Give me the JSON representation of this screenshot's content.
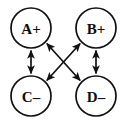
{
  "diagram": {
    "type": "graph",
    "title": "",
    "width": 127,
    "height": 123,
    "background_color": "#ffffff",
    "stroke_color": "#111111",
    "label_color": "#0d0d0d",
    "nodes": [
      {
        "id": "A",
        "label": "A+",
        "sign": "+",
        "cx": 31,
        "cy": 28,
        "r": 20
      },
      {
        "id": "B",
        "label": "B+",
        "sign": "+",
        "cx": 96,
        "cy": 28,
        "r": 20
      },
      {
        "id": "C",
        "label": "C–",
        "sign": "–",
        "cx": 31,
        "cy": 96,
        "r": 20
      },
      {
        "id": "D",
        "label": "D–",
        "sign": "–",
        "cx": 96,
        "cy": 96,
        "r": 20
      }
    ],
    "edges": [
      {
        "id": "A-C",
        "from": "A",
        "to": "C",
        "orientation": "vertical-left",
        "arrow": "double"
      },
      {
        "id": "B-D",
        "from": "B",
        "to": "D",
        "orientation": "vertical-right",
        "arrow": "double"
      },
      {
        "id": "A-D",
        "from": "A",
        "to": "D",
        "orientation": "diagonal-down-right",
        "arrow": "double"
      },
      {
        "id": "B-C",
        "from": "B",
        "to": "C",
        "orientation": "diagonal-down-left",
        "arrow": "double"
      }
    ],
    "edge_count": 4,
    "node_count": 4
  }
}
